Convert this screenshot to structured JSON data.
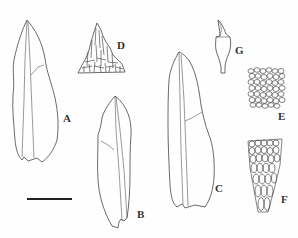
{
  "figure": {
    "type": "botanical illustration plate",
    "panels": [
      {
        "id": "A",
        "label": "A",
        "description": "leaf"
      },
      {
        "id": "B",
        "label": "B",
        "description": "leaf"
      },
      {
        "id": "C",
        "label": "C",
        "description": "leaf"
      },
      {
        "id": "D",
        "label": "D",
        "description": "leaf apex cells"
      },
      {
        "id": "E",
        "label": "E",
        "description": "median leaf cells"
      },
      {
        "id": "F",
        "label": "F",
        "description": "basal leaf cells"
      },
      {
        "id": "G",
        "label": "G",
        "description": "capsule"
      }
    ],
    "scale_bar": {
      "visible": true,
      "label": ""
    },
    "colors": {
      "line": "#444444",
      "background": "#fefefe"
    }
  }
}
